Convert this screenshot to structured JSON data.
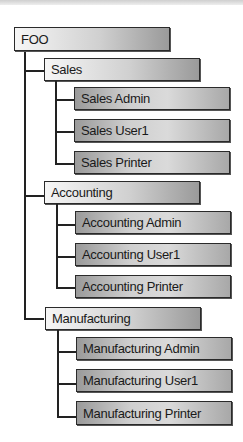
{
  "root": {
    "label": "FOO"
  },
  "groups": [
    {
      "label": "Sales",
      "children": [
        "Sales Admin",
        "Sales User1",
        "Sales Printer"
      ]
    },
    {
      "label": "Accounting",
      "children": [
        "Accounting Admin",
        "Accounting User1",
        "Accounting Printer"
      ]
    },
    {
      "label": "Manufacturing",
      "children": [
        "Manufacturing Admin",
        "Manufacturing User1",
        "Manufacturing Printer"
      ]
    }
  ]
}
